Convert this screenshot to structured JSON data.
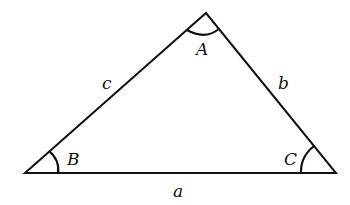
{
  "diagram": {
    "type": "triangle",
    "vertices": {
      "A": "A",
      "B": "B",
      "C": "C"
    },
    "sides": {
      "a": "a",
      "b": "b",
      "c": "c"
    },
    "stroke_color": "#111111"
  }
}
